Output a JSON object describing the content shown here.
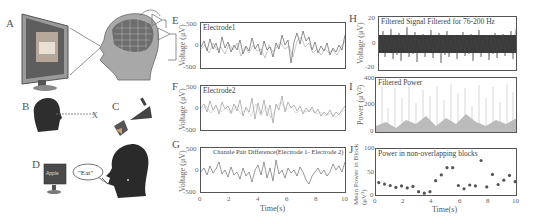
{
  "figure": {
    "panel_labels": [
      "A",
      "B",
      "C",
      "D",
      "E",
      "F",
      "G",
      "H",
      "I",
      "J"
    ],
    "illustrations": {
      "A": {
        "description": "monitor showing house picture, lines to head with brain cortex grid"
      },
      "B": {
        "description": "dark head silhouette gazing at target",
        "target_label": "X"
      },
      "C": {
        "description": "hand and foot motor icons"
      },
      "D": {
        "monitor_text": "Apple",
        "speech_bubble": "\"Eat\""
      }
    },
    "xlabel": "Time(s)",
    "xticks": [
      "0",
      "2",
      "4",
      "6",
      "8",
      "10"
    ]
  },
  "chart_data": [
    {
      "panel": "E",
      "type": "line",
      "title": "Electrode1",
      "xlabel": "",
      "ylabel": "Voltage (μV)",
      "yticks": [
        "500",
        "0",
        "-500"
      ],
      "ylim": [
        -600,
        600
      ],
      "xlim": [
        0,
        10
      ]
    },
    {
      "panel": "F",
      "type": "line",
      "title": "Electrode2",
      "xlabel": "",
      "ylabel": "Voltage (μV)",
      "yticks": [
        "500",
        "0",
        "-500"
      ],
      "ylim": [
        -600,
        600
      ],
      "xlim": [
        0,
        10
      ]
    },
    {
      "panel": "G",
      "type": "line",
      "title": "Chanale Pair Difference(Electrode 1- Electrode 2)",
      "xlabel": "Time(s)",
      "ylabel": "Voltage (μV)",
      "yticks": [
        "500",
        "0",
        "-500"
      ],
      "ylim": [
        -600,
        600
      ],
      "xlim": [
        0,
        10
      ],
      "xticks": [
        "0",
        "2",
        "4",
        "6",
        "8",
        "10"
      ]
    },
    {
      "panel": "H",
      "type": "line",
      "title": "Filtered Signal Filtered for 76-200 Hz",
      "xlabel": "",
      "ylabel": "Voltage (μV)",
      "yticks": [
        "20",
        "0",
        "-20"
      ],
      "ylim": [
        -22,
        22
      ],
      "xlim": [
        0,
        10
      ]
    },
    {
      "panel": "I",
      "type": "line",
      "title": "Filtered Power",
      "xlabel": "",
      "ylabel": "Power (μV²)",
      "yticks": [
        "400",
        "200",
        "0"
      ],
      "ylim": [
        0,
        400
      ],
      "xlim": [
        0,
        10
      ]
    },
    {
      "panel": "J",
      "type": "scatter",
      "title": "Power in non-overlapping blocks",
      "xlabel": "Time(s)",
      "ylabel": "Mean Power in Block (μV²)",
      "yticks": [
        "100",
        "50",
        "0"
      ],
      "ylim": [
        0,
        100
      ],
      "xlim": [
        0,
        10
      ],
      "xticks": [
        "0",
        "2",
        "4",
        "6",
        "8",
        "10"
      ],
      "x": [
        0.2,
        0.6,
        1.0,
        1.4,
        1.8,
        2.2,
        2.6,
        3.0,
        3.4,
        3.8,
        4.2,
        4.6,
        5.0,
        5.4,
        5.8,
        6.2,
        6.6,
        7.0,
        7.4,
        7.8,
        8.2,
        8.6,
        9.0,
        9.4,
        9.8
      ],
      "y": [
        30,
        27,
        24,
        20,
        23,
        19,
        22,
        11,
        8,
        11,
        34,
        46,
        61,
        61,
        24,
        17,
        25,
        23,
        76,
        21,
        47,
        26,
        35,
        45,
        32
      ]
    }
  ]
}
